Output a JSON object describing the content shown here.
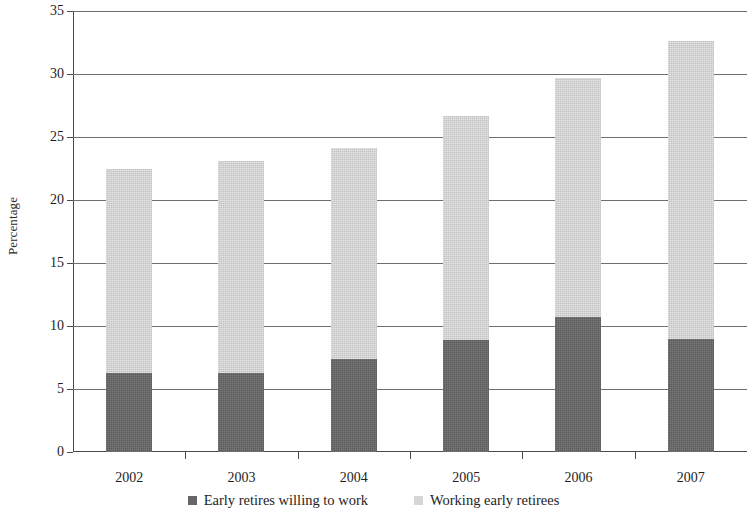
{
  "chart_data": {
    "type": "bar",
    "subtype": "stacked-bar",
    "title": "",
    "xlabel": "",
    "ylabel": "Percentage",
    "categories": [
      "2002",
      "2003",
      "2004",
      "2005",
      "2006",
      "2007"
    ],
    "series": [
      {
        "name": "Early retires willing to work",
        "color": "#666666",
        "values": [
          6.3,
          6.3,
          7.4,
          8.9,
          10.7,
          9.0
        ]
      },
      {
        "name": "Working early retirees",
        "color": "#d6d6d6",
        "values": [
          16.2,
          16.8,
          16.7,
          17.8,
          19.0,
          23.6
        ]
      }
    ],
    "totals": [
      22.5,
      23.1,
      24.1,
      26.7,
      29.7,
      32.6
    ],
    "ylim": [
      0,
      35
    ],
    "ytick_values": [
      0,
      5,
      10,
      15,
      20,
      25,
      30,
      35
    ],
    "ytick_labels": [
      "0",
      "5",
      "10",
      "15",
      "20",
      "25",
      "30",
      "35"
    ],
    "grid": "horizontal",
    "legend_position": "bottom"
  },
  "axes": {
    "y_title": "Percentage"
  },
  "legend": {
    "entries": [
      {
        "label": "Early retires willing to work",
        "swatch": "dark"
      },
      {
        "label": "Working early retirees",
        "swatch": "light"
      }
    ]
  }
}
